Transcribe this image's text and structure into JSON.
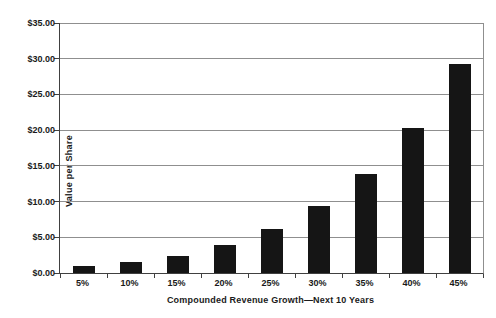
{
  "chart_data": {
    "type": "bar",
    "title": "",
    "categories": [
      "5%",
      "10%",
      "15%",
      "20%",
      "25%",
      "30%",
      "35%",
      "40%",
      "45%"
    ],
    "values": [
      1.0,
      1.55,
      2.35,
      3.95,
      6.15,
      9.45,
      13.9,
      20.3,
      29.2
    ],
    "xlabel": "Compounded Revenue Growth—Next 10 Years",
    "ylabel": "Value per Share",
    "ylim": [
      0,
      35
    ],
    "ytick_step": 5,
    "ytick_labels": [
      "$0.00",
      "$5.00",
      "$10.00",
      "$15.00",
      "$20.00",
      "$25.00",
      "$30.00",
      "$35.00"
    ],
    "bar_color": "#151515",
    "gridline_color": "#8f8f8f",
    "axis_color": "#404040",
    "grid": true,
    "legend": "none"
  }
}
